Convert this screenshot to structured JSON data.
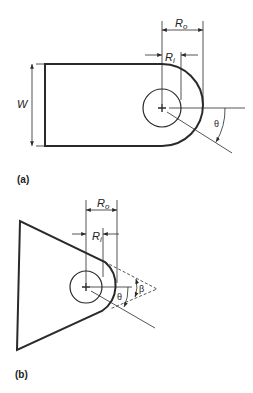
{
  "figure_a": {
    "caption": "(a)",
    "labels": {
      "width": "W",
      "outer_radius": "R",
      "outer_sub": "o",
      "inner_radius": "R",
      "inner_sub": "i",
      "angle": "θ"
    }
  },
  "figure_b": {
    "caption": "(b)",
    "labels": {
      "outer_radius": "R",
      "outer_sub": "o",
      "inner_radius": "R",
      "inner_sub": "i",
      "angle_theta": "θ",
      "angle_beta": "β"
    }
  },
  "colors": {
    "stroke": "#2a2a2a",
    "background": "#ffffff"
  }
}
